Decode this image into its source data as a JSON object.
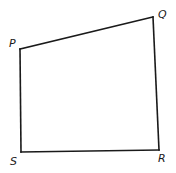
{
  "figure": {
    "type": "quadrilateral",
    "vertices": [
      {
        "id": "P",
        "label": "P"
      },
      {
        "id": "Q",
        "label": "Q"
      },
      {
        "id": "R",
        "label": "R"
      },
      {
        "id": "S",
        "label": "S"
      }
    ],
    "edges": [
      {
        "from": "P",
        "to": "Q",
        "name": "PQ"
      },
      {
        "from": "Q",
        "to": "R",
        "name": "QR"
      },
      {
        "from": "R",
        "to": "S",
        "name": "RS"
      },
      {
        "from": "S",
        "to": "P",
        "name": "SP"
      }
    ],
    "line_color": "#1a1a1a",
    "background": "#ffffff"
  }
}
